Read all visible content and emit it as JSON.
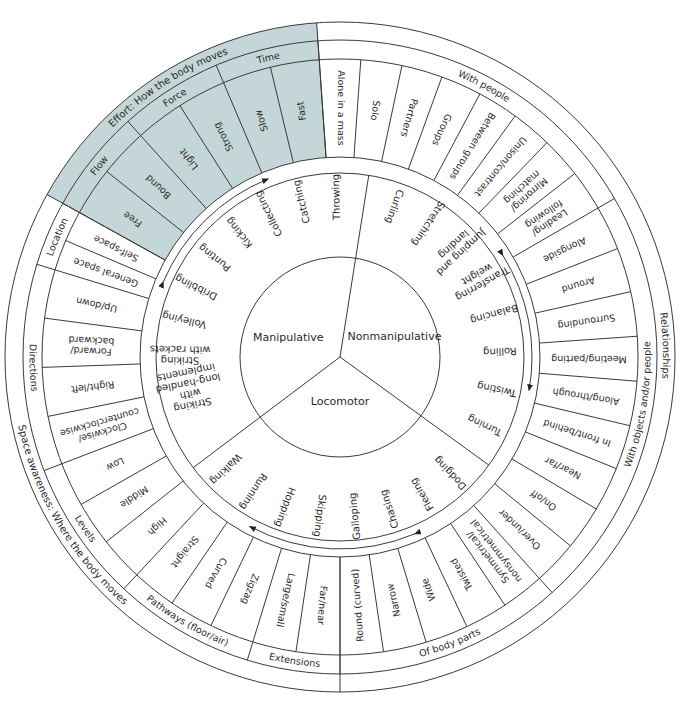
{
  "geometry": {
    "cx": 340,
    "cy": 357,
    "r_outer": 335,
    "r_category": 317,
    "r_sub": 298,
    "r_items_inner": 200,
    "r_arrow": 192,
    "r_skills_outer": 184,
    "r_center": 100
  },
  "colors": {
    "effort_fill": "#c5d6d8",
    "stroke": "#3a3a3a",
    "text": "#2a2a2a"
  },
  "center": {
    "dividers_deg": [
      9,
      126,
      233
    ],
    "labels": [
      {
        "text": "Manipulative",
        "angle": 290,
        "r": 55
      },
      {
        "text": "Nonmanipulative",
        "angle": 70,
        "r": 58
      },
      {
        "text": "Locomotor",
        "angle": 180,
        "r": 45
      }
    ]
  },
  "skills": {
    "manipulative": [
      "Throwing",
      "Catching",
      "Collecting",
      "Kicking",
      "Punting",
      "Dribbling",
      "Volleying",
      "Striking with rackets",
      "Striking with long-handled implements"
    ],
    "nonmanipulative": [
      "Curling",
      "Stretching",
      "Jumping and landing",
      "Transferring weight",
      "Balancing",
      "Rolling",
      "Twisting",
      "Turning"
    ],
    "locomotor": [
      "Dodging",
      "Fleeing",
      "Chasing",
      "Galloping",
      "Skipping",
      "Hopping",
      "Running",
      "Walking"
    ]
  },
  "categories": [
    {
      "id": "effort",
      "label": "Effort: How the body moves",
      "start": -61,
      "end": -4,
      "shaded": true,
      "subs": [
        {
          "label": "Flow",
          "start": -61,
          "end": -42,
          "items": [
            "Free",
            "Bound"
          ]
        },
        {
          "label": "Force",
          "start": -42,
          "end": -23,
          "items": [
            "Light",
            "Strong"
          ]
        },
        {
          "label": "Time",
          "start": -23,
          "end": -4,
          "items": [
            "Slow",
            "Fast"
          ]
        }
      ]
    },
    {
      "id": "relationships",
      "label": "Relationships",
      "start": -4,
      "end": 180,
      "shaded": false,
      "subs": [
        {
          "label": "With people",
          "start": -4,
          "end": 60,
          "items": [
            "Alone in a mass",
            "Solo",
            "Partners",
            "Groups",
            "Between groups",
            "Unison/contrast",
            "Mirroring/ matching",
            "Leading/ following"
          ]
        },
        {
          "label": "With objects and/or people",
          "start": 60,
          "end": 138,
          "items": [
            "Alongside",
            "Around",
            "Surrounding",
            "Meeting/parting",
            "Along/through",
            "In front/behind",
            "Near/far",
            "On/off",
            "Over/under"
          ]
        },
        {
          "label": "Of body parts",
          "start": 138,
          "end": 180,
          "items": [
            "Symmetrical/ nonsymmetrical",
            "Twisted",
            "Wide",
            "Narrow",
            "Round (curved)"
          ]
        }
      ]
    },
    {
      "id": "space",
      "label": "Space awareness: Where the body moves",
      "start": 180,
      "end": 299,
      "shaded": false,
      "subs": [
        {
          "label": "Extensions",
          "start": 180,
          "end": 197,
          "items": [
            "Far/near",
            "Large/small"
          ]
        },
        {
          "label": "Pathways (floor/air)",
          "start": 197,
          "end": 223,
          "items": [
            "Zigzag",
            "Curved",
            "Straight"
          ]
        },
        {
          "label": "Levels",
          "start": 223,
          "end": 249,
          "items": [
            "High",
            "Middle",
            "Low"
          ]
        },
        {
          "label": "Directions",
          "start": 249,
          "end": 287,
          "items": [
            "Clockwise/ counterclockwise",
            "Right/left",
            "Forward/ backward",
            "Up/down"
          ]
        },
        {
          "label": "Location",
          "start": 287,
          "end": 299,
          "items": [
            "General space",
            "Self-space"
          ]
        }
      ]
    }
  ],
  "arrows": [
    {
      "from": 293,
      "to": 338,
      "note": "Manipulative range arrow"
    },
    {
      "from": 58,
      "to": 100,
      "note": "Nonmanipulative range arrow"
    },
    {
      "from": 157,
      "to": 208,
      "note": "Locomotor range arrow"
    }
  ]
}
